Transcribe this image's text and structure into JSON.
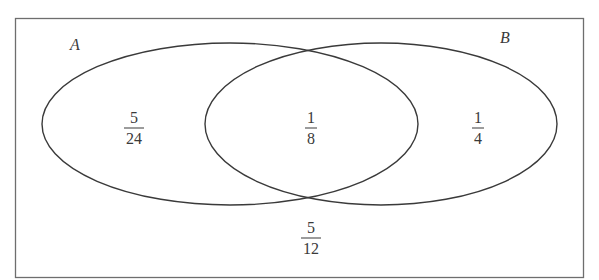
{
  "caption_fragment": "intersections.",
  "colors": {
    "background": "#ffffff",
    "stroke": "#3a3a3a",
    "border": "#6e6e6e",
    "text": "#3a3a3a"
  },
  "diagram": {
    "type": "venn-2-set",
    "border_box": {
      "x": 15,
      "y": 18,
      "width": 568,
      "height": 259
    },
    "sets": [
      {
        "name": "set-a",
        "label": "A",
        "label_x": 75,
        "label_y": 45,
        "cx": 230,
        "cy": 124,
        "rx": 188,
        "ry": 81
      },
      {
        "name": "set-b",
        "label": "B",
        "label_x": 505,
        "label_y": 38,
        "cx": 381,
        "cy": 124,
        "rx": 176,
        "ry": 81
      }
    ],
    "regions": [
      {
        "name": "region-a-only",
        "numerator": "5",
        "denominator": "24",
        "x": 134,
        "y": 128
      },
      {
        "name": "region-intersection",
        "numerator": "1",
        "denominator": "8",
        "x": 311,
        "y": 128
      },
      {
        "name": "region-b-only",
        "numerator": "1",
        "denominator": "4",
        "x": 478,
        "y": 128
      },
      {
        "name": "region-outside",
        "numerator": "5",
        "denominator": "12",
        "x": 311,
        "y": 238
      }
    ]
  }
}
